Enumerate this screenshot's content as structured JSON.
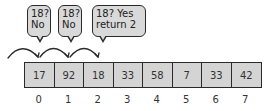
{
  "diagram": {
    "type": "linear-search",
    "target": 18,
    "bubbles": [
      {
        "line1": "18?",
        "line2": "No"
      },
      {
        "line1": "18?",
        "line2": "No"
      },
      {
        "line1": "18? Yes",
        "line2": "return 2"
      }
    ],
    "array": {
      "values": [
        "17",
        "92",
        "18",
        "33",
        "58",
        "7",
        "33",
        "42"
      ],
      "indices": [
        "0",
        "1",
        "2",
        "3",
        "4",
        "5",
        "6",
        "7"
      ]
    },
    "colors": {
      "cell_fill": "#d4d4d4",
      "bubble_fill": "#d9d9d9",
      "stroke": "#2a2a2a"
    }
  }
}
